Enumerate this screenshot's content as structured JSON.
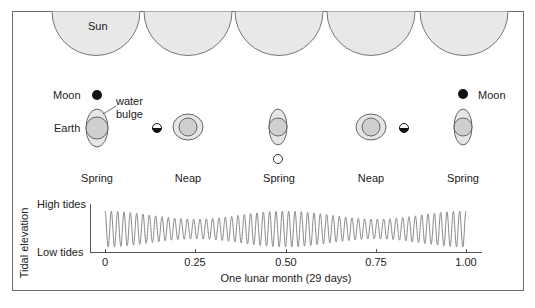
{
  "diagram": {
    "sun_label": "Sun",
    "moon_label_left": "Moon",
    "moon_label_right": "Moon",
    "earth_label": "Earth",
    "water_bulge_label_line1": "water",
    "water_bulge_label_line2": "bulge",
    "phases": [
      {
        "label": "Spring",
        "moon": "new-moon"
      },
      {
        "label": "Neap",
        "moon": "first-quarter"
      },
      {
        "label": "Spring",
        "moon": "full-moon"
      },
      {
        "label": "Neap",
        "moon": "last-quarter"
      },
      {
        "label": "Spring",
        "moon": "new-moon"
      }
    ]
  },
  "chart_data": {
    "type": "line",
    "title": "",
    "xlabel": "One lunar month (29 days)",
    "ylabel": "Tidal elevation",
    "y_tick_labels": [
      "High tides",
      "Low tides"
    ],
    "x_ticks": [
      0,
      0.25,
      0.5,
      0.75,
      1.0
    ],
    "x_tick_labels": [
      "0",
      "0.25",
      "0.50",
      "0.75",
      "1.00"
    ],
    "xlim": [
      0,
      1
    ],
    "grid": false,
    "legend": "none",
    "series": [
      {
        "name": "Tidal elevation",
        "cycles": 57,
        "amplitude_envelope": {
          "x": [
            0,
            0.25,
            0.5,
            0.75,
            1.0
          ],
          "relative_amplitude": [
            1.0,
            0.55,
            1.0,
            0.55,
            1.0
          ]
        }
      }
    ],
    "colors": {
      "line": "#8a8a8a",
      "axis": "#555555"
    }
  }
}
